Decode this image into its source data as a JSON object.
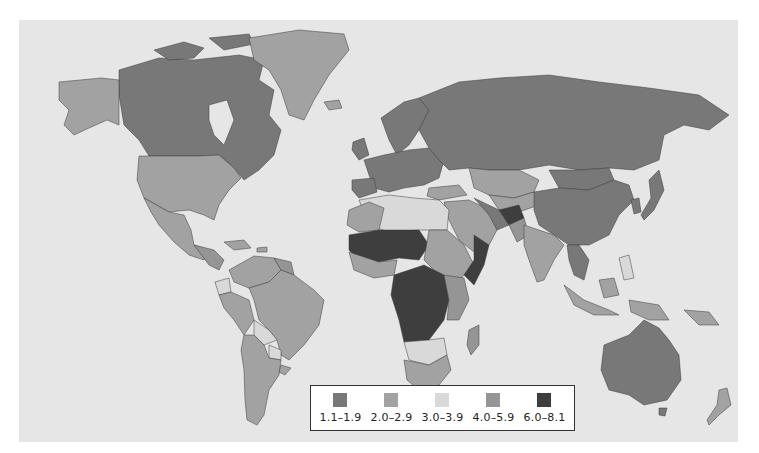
{
  "map": {
    "type": "choropleth",
    "ocean_color": "#e6e6e6",
    "border_color": "#3a3a3a"
  },
  "legend": {
    "items": [
      {
        "label": "1.1–1.9",
        "color": "#787878"
      },
      {
        "label": "2.0–2.9",
        "color": "#a2a2a2"
      },
      {
        "label": "3.0–3.9",
        "color": "#d9d9d9"
      },
      {
        "label": "4.0–5.9",
        "color": "#959595"
      },
      {
        "label": "6.0–8.1",
        "color": "#3e3e3e"
      }
    ]
  },
  "regions": [
    {
      "name": "canada",
      "cls": 0,
      "d": "M100 50 L140 38 L175 40 L220 35 L245 40 L240 60 L255 70 L250 95 L262 110 L255 135 L240 150 L225 160 L215 148 L200 135 L180 136 L130 136 L120 120 L105 105 L100 75 Z"
    },
    {
      "name": "canada-arctic-islands",
      "cls": 0,
      "d": "M135 30 L165 22 L185 28 L175 38 L150 40 Z M190 18 L230 14 L235 24 L205 30 Z"
    },
    {
      "name": "hudson-bay",
      "cls": -1,
      "d": "M190 85 L208 80 L215 100 L205 125 L195 115 L190 100 Z"
    },
    {
      "name": "alaska",
      "cls": 1,
      "d": "M40 62 L82 58 L100 60 L100 105 L88 100 L70 108 L55 115 L45 105 L50 90 L40 80 Z"
    },
    {
      "name": "greenland",
      "cls": 1,
      "d": "M230 18 L280 10 L325 14 L330 30 L310 55 L295 80 L285 100 L270 95 L262 70 L250 50 L235 40 Z"
    },
    {
      "name": "iceland",
      "cls": 1,
      "d": "M305 82 L320 80 L323 88 L310 90 Z"
    },
    {
      "name": "usa",
      "cls": 1,
      "d": "M120 136 L180 136 L200 135 L215 148 L222 158 L210 170 L200 185 L195 200 L185 195 L170 190 L150 192 L138 185 L125 178 L118 160 Z"
    },
    {
      "name": "mexico",
      "cls": 1,
      "d": "M125 178 L150 192 L165 195 L172 210 L175 225 L190 230 L185 240 L170 235 L155 222 L140 205 L132 192 Z"
    },
    {
      "name": "central-america",
      "cls": 3,
      "d": "M175 225 L195 230 L205 240 L200 250 L190 245 Z"
    },
    {
      "name": "caribbean",
      "cls": 1,
      "d": "M205 222 L225 220 L232 228 L215 230 Z M238 228 L248 227 L248 232 L238 232 Z"
    },
    {
      "name": "colombia-venezuela",
      "cls": 1,
      "d": "M210 250 L235 236 L255 238 L262 250 L250 262 L230 268 L215 262 Z"
    },
    {
      "name": "guianas",
      "cls": 3,
      "d": "M255 238 L272 242 L275 255 L262 250 Z"
    },
    {
      "name": "ecuador",
      "cls": 2,
      "d": "M196 262 L210 258 L212 272 L200 275 Z"
    },
    {
      "name": "peru",
      "cls": 1,
      "d": "M200 275 L212 272 L230 280 L235 300 L225 315 L215 300 L205 288 Z"
    },
    {
      "name": "brazil",
      "cls": 1,
      "d": "M230 268 L250 262 L262 250 L275 255 L295 270 L305 280 L300 305 L285 325 L270 340 L262 335 L258 320 L250 310 L240 300 L235 280 Z"
    },
    {
      "name": "bolivia",
      "cls": 2,
      "d": "M235 300 L250 310 L258 320 L245 325 L235 315 Z"
    },
    {
      "name": "paraguay",
      "cls": 2,
      "d": "M250 325 L262 330 L262 340 L250 338 Z"
    },
    {
      "name": "argentina-chile",
      "cls": 1,
      "d": "M225 315 L235 315 L245 325 L250 338 L262 340 L260 355 L250 370 L245 395 L238 405 L228 400 L226 380 L225 350 L222 330 Z"
    },
    {
      "name": "uruguay",
      "cls": 1,
      "d": "M262 345 L272 348 L266 355 L260 352 Z"
    },
    {
      "name": "uk-ireland",
      "cls": 0,
      "d": "M334 122 L345 118 L350 135 L340 140 L333 130 Z"
    },
    {
      "name": "scandinavia",
      "cls": 0,
      "d": "M362 98 L385 82 L400 78 L410 90 L400 110 L390 125 L378 135 L370 120 Z"
    },
    {
      "name": "western-europe",
      "cls": 0,
      "d": "M345 140 L365 135 L390 130 L410 128 L425 140 L420 158 L405 165 L385 168 L370 172 L355 168 L350 155 Z"
    },
    {
      "name": "iberia",
      "cls": 0,
      "d": "M333 160 L355 158 L358 172 L340 178 L333 170 Z"
    },
    {
      "name": "russia",
      "cls": 0,
      "d": "M400 78 L440 62 L480 58 L530 55 L580 62 L630 68 L680 75 L710 95 L690 110 L665 105 L645 115 L640 140 L615 150 L590 148 L560 150 L530 145 L500 150 L470 150 L450 148 L430 150 L420 140 L410 128 L400 110 L410 90 Z"
    },
    {
      "name": "kazakhstan",
      "cls": 1,
      "d": "M450 148 L470 150 L500 150 L520 160 L515 172 L495 178 L470 175 L455 168 Z"
    },
    {
      "name": "central-asia",
      "cls": 1,
      "d": "M470 175 L495 178 L515 172 L520 185 L500 192 L480 190 Z"
    },
    {
      "name": "mongolia",
      "cls": 0,
      "d": "M530 150 L560 150 L590 148 L595 160 L570 170 L540 168 Z"
    },
    {
      "name": "china",
      "cls": 0,
      "d": "M515 172 L540 168 L570 170 L595 160 L610 165 L615 180 L600 195 L590 215 L570 225 L550 225 L535 215 L520 205 L515 190 Z"
    },
    {
      "name": "korea-japan",
      "cls": 0,
      "d": "M612 180 L620 178 L622 192 L615 194 Z M630 160 L640 150 L645 170 L635 190 L625 200 L622 195 L632 178 Z"
    },
    {
      "name": "turkey",
      "cls": 1,
      "d": "M410 168 L440 165 L448 175 L420 180 L408 176 Z"
    },
    {
      "name": "middle-east-arabia",
      "cls": 1,
      "d": "M425 182 L450 180 L470 190 L478 210 L470 225 L455 232 L440 220 L430 200 Z"
    },
    {
      "name": "iran",
      "cls": 0,
      "d": "M455 178 L480 190 L490 205 L478 210 L470 195 Z"
    },
    {
      "name": "afghanistan",
      "cls": 4,
      "d": "M480 190 L500 185 L505 198 L490 205 Z"
    },
    {
      "name": "pakistan",
      "cls": 3,
      "d": "M490 205 L505 198 L510 215 L498 222 Z"
    },
    {
      "name": "india",
      "cls": 1,
      "d": "M505 205 L535 215 L545 225 L535 240 L525 260 L518 262 L510 240 L505 225 Z"
    },
    {
      "name": "southeast-asia",
      "cls": 0,
      "d": "M548 225 L560 225 L570 240 L565 260 L555 255 L550 240 Z"
    },
    {
      "name": "indonesia",
      "cls": 1,
      "d": "M545 265 L565 280 L590 290 L600 295 L575 295 L555 285 Z M580 260 L595 258 L600 275 L585 278 Z M610 280 L640 285 L650 300 L630 300 L612 292 Z"
    },
    {
      "name": "philippines",
      "cls": 2,
      "d": "M600 238 L610 235 L615 258 L605 260 Z"
    },
    {
      "name": "north-africa",
      "cls": 2,
      "d": "M340 180 L370 175 L395 178 L420 180 L430 190 L428 210 L400 210 L370 212 L350 205 Z"
    },
    {
      "name": "maghreb",
      "cls": 1,
      "d": "M330 190 L350 182 L365 188 L360 210 L340 212 L328 205 Z"
    },
    {
      "name": "sahel-west-africa",
      "cls": 4,
      "d": "M330 215 L360 210 L400 210 L410 225 L400 240 L380 238 L360 242 L340 240 L330 230 Z"
    },
    {
      "name": "coastal-west-africa",
      "cls": 1,
      "d": "M330 232 L360 242 L378 240 L375 255 L355 258 L335 250 Z"
    },
    {
      "name": "sudan-ethiopia",
      "cls": 1,
      "d": "M410 210 L428 210 L445 225 L455 245 L440 260 L420 255 L405 240 Z"
    },
    {
      "name": "horn-of-africa",
      "cls": 4,
      "d": "M455 215 L470 225 L465 245 L455 265 L445 255 L455 240 Z"
    },
    {
      "name": "central-africa",
      "cls": 4,
      "d": "M375 255 L405 245 L425 255 L430 280 L425 300 L410 320 L385 322 L380 300 L372 275 Z"
    },
    {
      "name": "east-africa",
      "cls": 3,
      "d": "M425 255 L445 258 L450 280 L440 300 L428 300 L430 280 Z"
    },
    {
      "name": "southern-africa-mid",
      "cls": 2,
      "d": "M385 322 L410 320 L425 318 L428 335 L410 345 L390 340 Z"
    },
    {
      "name": "south-africa",
      "cls": 1,
      "d": "M385 340 L410 345 L428 335 L432 350 L420 365 L400 370 L388 360 Z"
    },
    {
      "name": "madagascar",
      "cls": 3,
      "d": "M450 310 L460 305 L460 325 L452 335 L448 325 Z"
    },
    {
      "name": "australia",
      "cls": 0,
      "d": "M585 325 L610 315 L625 300 L640 308 L650 320 L660 335 L662 360 L648 380 L625 385 L610 375 L590 370 L582 350 Z"
    },
    {
      "name": "tasmania",
      "cls": 0,
      "d": "M640 388 L648 388 L646 396 L640 395 Z"
    },
    {
      "name": "new-zealand",
      "cls": 1,
      "d": "M700 370 L708 368 L712 385 L700 395 L690 405 L688 400 L698 385 Z"
    },
    {
      "name": "papua",
      "cls": 1,
      "d": "M665 290 L690 292 L700 305 L680 305 Z"
    }
  ]
}
